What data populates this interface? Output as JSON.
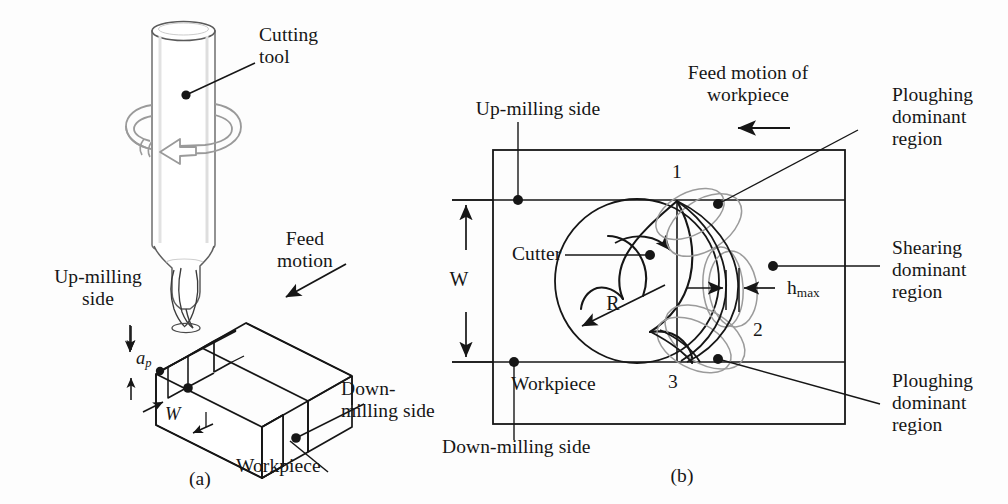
{
  "figure": {
    "kind": "technical-diagram",
    "ink_color": "#161616",
    "shade_color": "#8a8a8a",
    "background": "#fdfdfd"
  },
  "panel_a": {
    "tag": "(a)",
    "labels": {
      "cutting_tool": "Cutting\ntool",
      "feed_motion": "Feed\nmotion",
      "up_milling_side": "Up-milling\nside",
      "down_milling_side": "Down-\nmilling side",
      "workpiece": "Workpiece",
      "axial_depth": "a",
      "axial_depth_sub": "p",
      "width_of_cut": "W"
    },
    "icons": {
      "spindle_rotation": "rotation-arrow-icon",
      "feed_direction": "arrow-icon"
    }
  },
  "panel_b": {
    "tag": "(b)",
    "labels": {
      "up_milling_side": "Up-milling side",
      "down_milling_side": "Down-milling side",
      "feed_motion_of_workpiece": "Feed motion of\nworkpiece",
      "workpiece": "Workpiece",
      "cutter": "Cutter",
      "radius": "R",
      "width_of_cut": "W",
      "max_chip_thickness": "h",
      "max_chip_thickness_sub": "max",
      "ploughing_top": "Ploughing\ndominant\nregion",
      "shearing_middle": "Shearing\ndominant\nregion",
      "ploughing_bottom": "Ploughing\ndominant\nregion"
    },
    "position_markers": [
      "1",
      "2",
      "3"
    ],
    "icons": {
      "feed_direction": "left-arrow-icon",
      "cutter_rotation": "rotation-arrow-icon",
      "radius_arrow": "radius-arrow-icon",
      "chip_thickness_dimension": "dimension-arrow-icon"
    }
  }
}
